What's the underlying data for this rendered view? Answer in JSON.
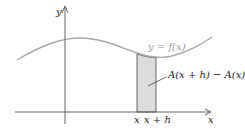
{
  "diagram": {
    "y_axis_label": "y",
    "x_axis_label": "x",
    "curve_label": "y = f(x)",
    "area_label": "A(x + h) − A(x)",
    "tick_x": "x",
    "tick_xh": "x + h",
    "colors": {
      "curve": "#a8a8a8",
      "strip_fill": "#dcdcdc",
      "axes": "#555555"
    }
  }
}
